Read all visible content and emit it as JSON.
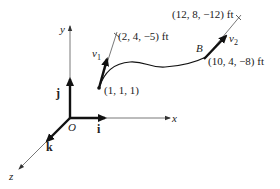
{
  "axes": {
    "x_label": "x",
    "y_label": "y",
    "z_label": "z",
    "origin_label": "O"
  },
  "unit_vectors": {
    "i": "i",
    "j": "j",
    "k": "k"
  },
  "points": {
    "start": "(1, 1, 1)",
    "tangent1_end": "(2, 4, −5) ft",
    "B_label": "B",
    "B_coords": "(10, 4, −8) ft",
    "tangent2_end": "(12, 8, −12) ft"
  },
  "velocities": {
    "v1": "v",
    "v1_sub": "1",
    "v2": "v",
    "v2_sub": "2"
  },
  "colors": {
    "ink": "#222222",
    "thin": "#555555"
  }
}
